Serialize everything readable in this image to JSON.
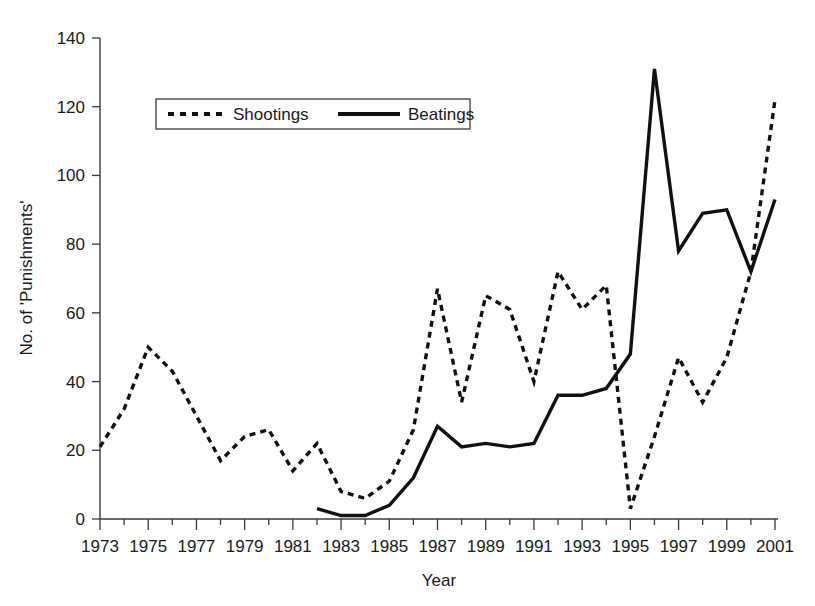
{
  "chart_data": {
    "type": "line",
    "title": "",
    "xlabel": "Year",
    "ylabel": "No. of 'Punishments'",
    "xlim": [
      1973,
      2001
    ],
    "ylim": [
      0,
      140
    ],
    "grid": false,
    "legend_position": "top-left",
    "y_ticks": [
      0,
      20,
      40,
      60,
      80,
      100,
      120,
      140
    ],
    "y_tick_labels": [
      "0",
      "20",
      "40",
      "60",
      "80",
      "100",
      "120",
      "140"
    ],
    "x_ticks": [
      1973,
      1975,
      1977,
      1979,
      1981,
      1983,
      1985,
      1987,
      1989,
      1991,
      1993,
      1995,
      1997,
      1999,
      2001
    ],
    "x_tick_labels": [
      "1973",
      "1975",
      "1977",
      "1979",
      "1981",
      "1983",
      "1985",
      "1987",
      "1989",
      "1991",
      "1993",
      "1995",
      "1997",
      "1999",
      "2001"
    ],
    "x_minor_ticks": [
      1974,
      1976,
      1978,
      1980,
      1982,
      1984,
      1986,
      1988,
      1990,
      1992,
      1994,
      1996,
      1998,
      2000
    ],
    "series": [
      {
        "name": "Shootings",
        "style": "dashed",
        "color": "#111111",
        "x": [
          1973,
          1974,
          1975,
          1976,
          1977,
          1978,
          1979,
          1980,
          1981,
          1982,
          1983,
          1984,
          1985,
          1986,
          1987,
          1988,
          1989,
          1990,
          1991,
          1992,
          1993,
          1994,
          1995,
          1996,
          1997,
          1998,
          1999,
          2000,
          2001
        ],
        "values": [
          21,
          32,
          50,
          43,
          30,
          17,
          24,
          26,
          14,
          22,
          8,
          6,
          11,
          26,
          67,
          34,
          65,
          61,
          40,
          72,
          61,
          68,
          3,
          24,
          47,
          34,
          47,
          72,
          122
        ]
      },
      {
        "name": "Beatings",
        "style": "solid",
        "color": "#111111",
        "x": [
          1982,
          1983,
          1984,
          1985,
          1986,
          1987,
          1988,
          1989,
          1990,
          1991,
          1992,
          1993,
          1994,
          1995,
          1996,
          1997,
          1998,
          1999,
          2000,
          2001
        ],
        "values": [
          3,
          1,
          1,
          4,
          12,
          27,
          21,
          22,
          21,
          22,
          36,
          36,
          38,
          48,
          131,
          78,
          89,
          90,
          72,
          93
        ]
      }
    ]
  },
  "legend": {
    "items": [
      {
        "label": "Shootings",
        "style": "dashed"
      },
      {
        "label": "Beatings",
        "style": "solid"
      }
    ]
  },
  "axes": {
    "x_title": "Year",
    "y_title": "No. of 'Punishments'"
  }
}
